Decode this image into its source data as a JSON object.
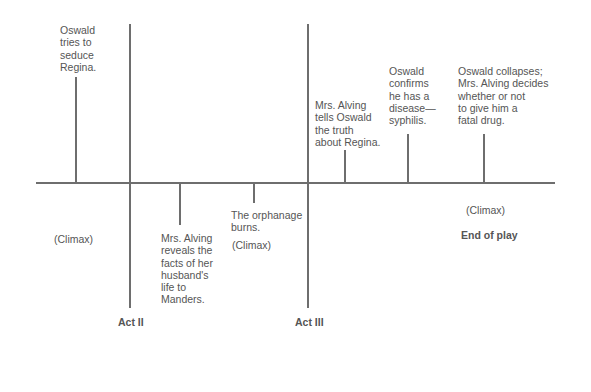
{
  "diagram": {
    "title": "",
    "type": "plot-timeline",
    "acts": [
      {
        "label": "Act II"
      },
      {
        "label": "Act III"
      }
    ],
    "events": [
      {
        "text": "Oswald\ntries to\nseduce\nRegina.",
        "position": "above",
        "note": "(Climax)"
      },
      {
        "text": "Mrs. Alving\nreveals the\nfacts of her\nhusband's\nlife to\nManders.",
        "position": "below"
      },
      {
        "text": "The orphanage\nburns.",
        "position": "below",
        "note": "(Climax)"
      },
      {
        "text": "Mrs. Alving\ntells Oswald\nthe truth\nabout Regina.",
        "position": "above"
      },
      {
        "text": "Oswald\nconfirms\nhe has a\ndisease—\nsyphilis.",
        "position": "above"
      },
      {
        "text": "Oswald collapses;\nMrs. Alving decides\nwhether or not\nto give him a\nfatal drug.",
        "position": "above",
        "note": "(Climax)"
      }
    ],
    "end_label": "End of play"
  }
}
